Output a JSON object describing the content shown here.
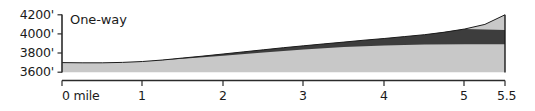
{
  "chart_data": {
    "type": "area",
    "title": "",
    "series_label": "One-way",
    "xlabel": "",
    "ylabel": "",
    "xlim": [
      0,
      5.5
    ],
    "ylim": [
      3600,
      4200
    ],
    "grid": false,
    "legend_position": "inside-top-left",
    "x_tick_labels": [
      "0 mile",
      "1",
      "2",
      "3",
      "4",
      "5",
      "5.5"
    ],
    "x_ticks": [
      0,
      1,
      2,
      3,
      4,
      5,
      5.5
    ],
    "y_tick_labels": [
      "4200'",
      "4000'",
      "3800'",
      "3600'"
    ],
    "y_ticks": [
      4200,
      4000,
      3800,
      3600
    ],
    "axis_unit_x": "mile",
    "axis_unit_y": "feet",
    "series": [
      {
        "name": "elevation-profile",
        "color": "#c9c9c9",
        "x": [
          0,
          0.25,
          0.5,
          0.75,
          1,
          1.25,
          1.5,
          1.75,
          2,
          2.25,
          2.5,
          2.75,
          3,
          3.25,
          3.5,
          3.75,
          4,
          4.25,
          4.5,
          4.75,
          5,
          5.25,
          5.5
        ],
        "values": [
          3700,
          3698,
          3698,
          3702,
          3712,
          3728,
          3748,
          3768,
          3790,
          3812,
          3834,
          3856,
          3876,
          3896,
          3915,
          3934,
          3952,
          3972,
          3992,
          4018,
          4052,
          4100,
          4200
        ]
      },
      {
        "name": "upper-band-top",
        "color": "#3f3f3f",
        "x": [
          1.1,
          1.5,
          2,
          2.5,
          3,
          3.5,
          4,
          4.5,
          5,
          5.5
        ],
        "values": [
          3718,
          3748,
          3790,
          3834,
          3876,
          3915,
          3952,
          3992,
          4052,
          4040
        ]
      },
      {
        "name": "upper-band-bottom",
        "color": "#3f3f3f",
        "x": [
          1.1,
          1.5,
          2,
          2.5,
          3,
          3.5,
          4,
          4.5,
          5,
          5.5
        ],
        "values": [
          3718,
          3740,
          3772,
          3806,
          3838,
          3862,
          3880,
          3888,
          3892,
          3892
        ]
      }
    ],
    "colors": {
      "fill_light": "#c8c8c8",
      "fill_dark": "#3d3d3d",
      "outline": "#1b1b1b",
      "axis": "#2b2b2b",
      "text": "#1b1b1b",
      "background": "#ffffff"
    }
  }
}
